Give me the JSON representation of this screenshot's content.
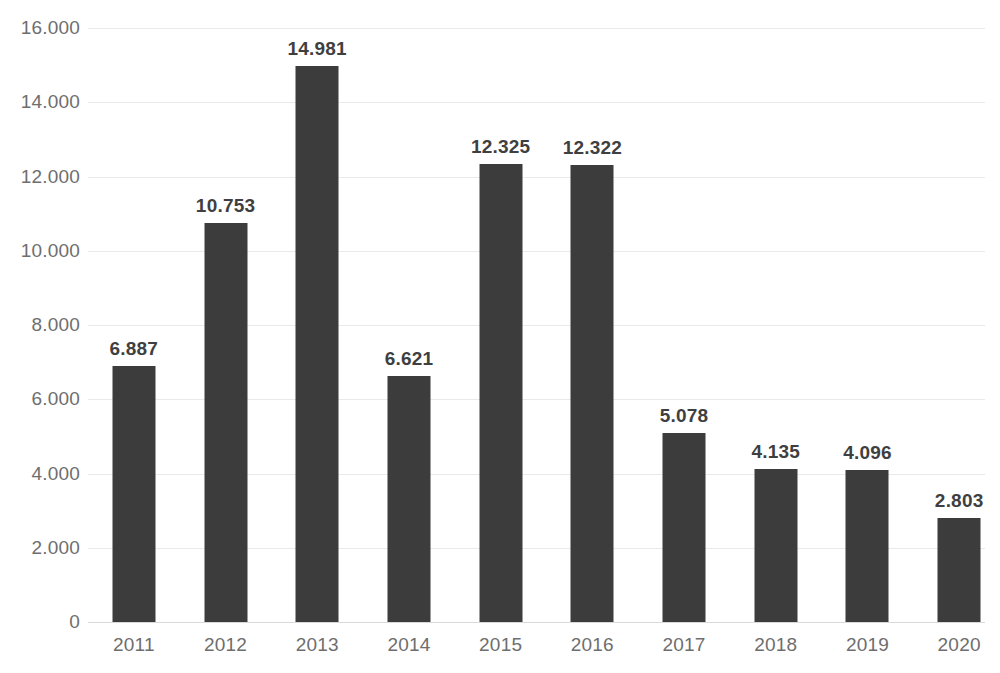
{
  "chart_data": {
    "type": "bar",
    "title": "",
    "subtitle": "",
    "xlabel": "",
    "ylabel": "",
    "categories": [
      "2011",
      "2012",
      "2013",
      "2014",
      "2015",
      "2016",
      "2017",
      "2018",
      "2019",
      "2020"
    ],
    "values": [
      6887,
      10753,
      14981,
      6621,
      12325,
      12322,
      5078,
      4135,
      4096,
      2803
    ],
    "value_labels": [
      "6.887",
      "10.753",
      "14.981",
      "6.621",
      "12.325",
      "12.322",
      "5.078",
      "4.135",
      "4.096",
      "2.803"
    ],
    "ylim": [
      0,
      16000
    ],
    "y_ticks": [
      0,
      2000,
      4000,
      6000,
      8000,
      10000,
      12000,
      14000,
      16000
    ],
    "y_tick_labels": [
      "0",
      "2.000",
      "4.000",
      "6.000",
      "8.000",
      "10.000",
      "12.000",
      "14.000",
      "16.000"
    ],
    "grid": true,
    "legend": "none",
    "series": [
      {
        "name": "",
        "values": [
          6887,
          10753,
          14981,
          6621,
          12325,
          12322,
          5078,
          4135,
          4096,
          2803
        ]
      }
    ],
    "colors": {
      "bar": "#3c3c3c",
      "gridline": "#e9e9e9",
      "axis_line": "#d9d9d9",
      "tick_label": "#6e6e6e",
      "data_label": "#3f3f3f",
      "background": "#ffffff"
    },
    "number_format": "european-thousands-dot",
    "data_labels_shown": true
  }
}
